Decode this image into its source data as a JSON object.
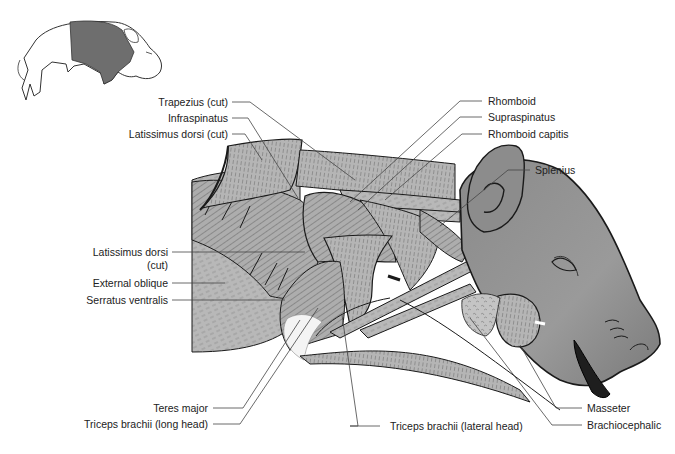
{
  "figure": {
    "colors": {
      "background": "#ffffff",
      "muscle_fill": "#b3b3b3",
      "muscle_dark": "#9a9a9a",
      "head_fill": "#8f8f8f",
      "outline": "#1a1a1a",
      "leader_line": "#444444",
      "text": "#222222",
      "locator_highlight": "#6e6e6e"
    },
    "locator_icon": {
      "name": "pig-orientation-icon",
      "highlighted_region": "shoulder-and-neck"
    },
    "labels_left": [
      {
        "id": "trapezius",
        "text": "Trapezius (cut)"
      },
      {
        "id": "infraspinatus",
        "text": "Infraspinatus"
      },
      {
        "id": "latissimus-top",
        "text": "Latissimus dorsi (cut)"
      },
      {
        "id": "latissimus-mid-1",
        "text": "Latissimus dorsi"
      },
      {
        "id": "latissimus-mid-2",
        "text": "(cut)"
      },
      {
        "id": "external-oblique",
        "text": "External oblique"
      },
      {
        "id": "serratus",
        "text": "Serratus ventralis"
      }
    ],
    "labels_right": [
      {
        "id": "rhomboid",
        "text": "Rhomboid"
      },
      {
        "id": "supraspinatus",
        "text": "Supraspinatus"
      },
      {
        "id": "rhomboid-capitis",
        "text": "Rhomboid capitis"
      },
      {
        "id": "splenius",
        "text": "Splenius"
      }
    ],
    "labels_bottom": [
      {
        "id": "teres-major",
        "text": "Teres major"
      },
      {
        "id": "triceps-long",
        "text": "Triceps brachii (long head)"
      },
      {
        "id": "triceps-lateral",
        "text": "Triceps brachii (lateral head)"
      },
      {
        "id": "masseter",
        "text": "Masseter"
      },
      {
        "id": "brachiocephalic",
        "text": "Brachiocephalic"
      }
    ]
  }
}
